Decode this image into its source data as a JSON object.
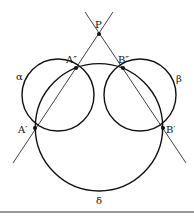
{
  "diagram": {
    "colors": {
      "stroke": "#111111",
      "background": "#ffffff",
      "rule": "#333333"
    },
    "points": {
      "P": {
        "label": "P",
        "x": 99,
        "y": 34
      },
      "A2": {
        "label": "A″",
        "x": 76,
        "y": 68
      },
      "B2": {
        "label": "B″",
        "x": 123,
        "y": 68
      },
      "A1": {
        "label": "A′",
        "x": 35,
        "y": 128
      },
      "B1": {
        "label": "B′",
        "x": 163,
        "y": 128
      }
    },
    "circles": {
      "alpha": {
        "label": "α",
        "cx": 58,
        "cy": 95,
        "r": 36
      },
      "beta": {
        "label": "β",
        "cx": 140,
        "cy": 95,
        "r": 36
      },
      "delta": {
        "label": "δ",
        "cx": 99,
        "cy": 127.3,
        "r": 63.7
      }
    },
    "lines": [
      {
        "name": "line-PA",
        "through": [
          "P",
          "A″",
          "A′"
        ]
      },
      {
        "name": "line-PB",
        "through": [
          "P",
          "B″",
          "B′"
        ]
      }
    ]
  }
}
